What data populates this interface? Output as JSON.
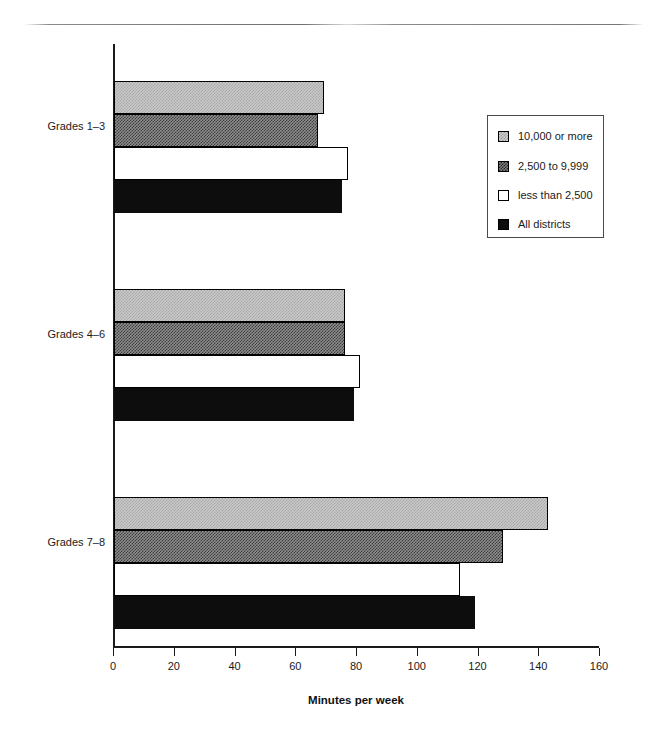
{
  "chart_data": {
    "type": "bar",
    "orientation": "horizontal",
    "title": "",
    "xlabel": "Minutes per week",
    "ylabel": "",
    "xlim": [
      0,
      160
    ],
    "xticks": [
      0,
      20,
      40,
      60,
      80,
      100,
      120,
      140,
      160
    ],
    "xtick_labels": [
      "0",
      "20",
      "40",
      "60",
      "80",
      "100",
      "120",
      "140",
      "160"
    ],
    "grid": false,
    "legend_position": "right",
    "categories": [
      "Grades 1–3",
      "Grades 4–6",
      "Grades 7–8"
    ],
    "series": [
      {
        "name": "10,000 or more",
        "values": [
          69,
          76,
          143
        ]
      },
      {
        "name": "2,500 to 9,999",
        "values": [
          67,
          76,
          128
        ]
      },
      {
        "name": "less than 2,500",
        "values": [
          77,
          81,
          114
        ]
      },
      {
        "name": "All districts",
        "values": [
          75,
          79,
          119
        ]
      }
    ]
  },
  "legend": {
    "items": [
      {
        "label": "10,000 or more",
        "swatch": "light-dither-swatch"
      },
      {
        "label": "2,500 to 9,999",
        "swatch": "dark-dither-swatch"
      },
      {
        "label": "less than 2,500",
        "swatch": "white-swatch"
      },
      {
        "label": "All districts",
        "swatch": "black-swatch"
      }
    ]
  },
  "axis": {
    "title": "Minutes per week",
    "tick_labels": [
      "0",
      "20",
      "40",
      "60",
      "80",
      "100",
      "120",
      "140",
      "160"
    ]
  },
  "categories": [
    "Grades 1–3",
    "Grades 4–6",
    "Grades 7–8"
  ]
}
